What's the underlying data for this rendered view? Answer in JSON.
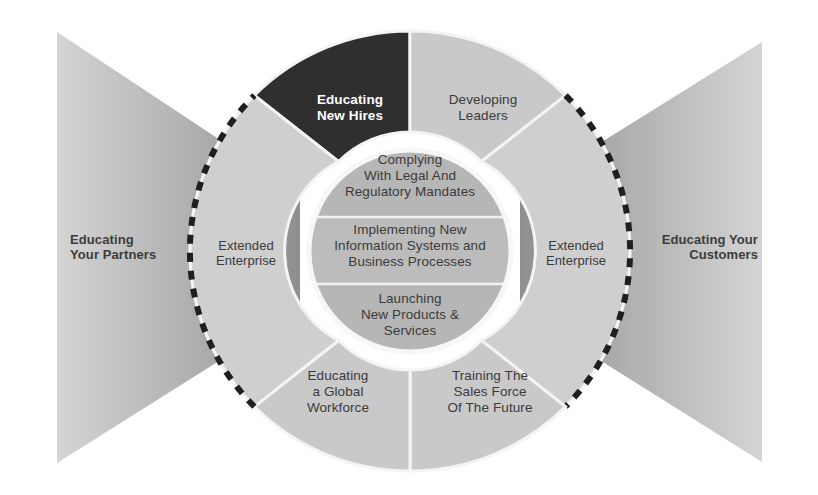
{
  "figure": {
    "kind": "radial-wheel-diagram",
    "background_color": "#ffffff"
  },
  "colors": {
    "highlight_sector": "#2f2f2f",
    "outer_sector": "#c9c9c9",
    "extended_sector": "#cfcfcf",
    "inner_circle": "#b4b4b4",
    "inner_band_alt": "#b9b9b9",
    "wing_dark": "#9a9a9a",
    "wing_light": "#d6d6d6",
    "divider": "#f2f2f2",
    "dashed_arc": "#1f1f1f",
    "text_dark": "#3a3a3a",
    "text_light": "#ffffff"
  },
  "outer_sectors": [
    {
      "id": "educating-new-hires",
      "label": "Educating\nNew Hires",
      "highlighted": true,
      "text_color": "#ffffff"
    },
    {
      "id": "developing-leaders",
      "label": "Developing\nLeaders",
      "highlighted": false,
      "text_color": "#3a3a3a"
    },
    {
      "id": "extended-enterprise-right",
      "label": "Extended\nEnterprise",
      "highlighted": false,
      "text_color": "#3a3a3a"
    },
    {
      "id": "training-sales-force",
      "label": "Training The\nSales Force\nOf The Future",
      "highlighted": false,
      "text_color": "#3a3a3a"
    },
    {
      "id": "educating-global-workforce",
      "label": "Educating\na Global\nWorkforce",
      "highlighted": false,
      "text_color": "#3a3a3a"
    },
    {
      "id": "extended-enterprise-left",
      "label": "Extended\nEnterprise",
      "highlighted": false,
      "text_color": "#3a3a3a"
    }
  ],
  "inner_bands": [
    {
      "id": "complying-legal",
      "label": "Complying\nWith Legal And\nRegulatory Mandates"
    },
    {
      "id": "implementing-systems",
      "label": "Implementing New\nInformation Systems and\nBusiness Processes"
    },
    {
      "id": "launching-products",
      "label": "Launching\nNew Products &\nServices"
    }
  ],
  "wings": [
    {
      "id": "educating-your-partners",
      "label": "Educating\nYour Partners",
      "side": "left"
    },
    {
      "id": "educating-your-customers",
      "label": "Educating Your\nCustomers",
      "side": "right"
    }
  ]
}
